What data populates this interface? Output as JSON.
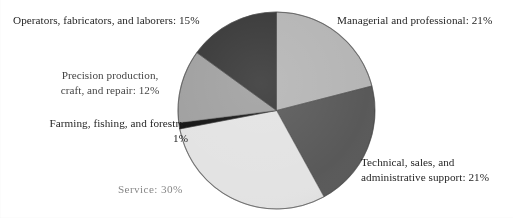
{
  "chart_data": {
    "type": "pie",
    "title": "",
    "subtitle": "",
    "xlabel": "",
    "ylabel": "",
    "legend_position": "none",
    "grid": false,
    "labels_position": "outside",
    "units": "percent",
    "total": 100,
    "categories": [
      "Managerial and professional",
      "Technical, sales, and administrative support",
      "Service",
      "Farming, fishing, and forestry",
      "Precision production, craft, and repair",
      "Operators, fabricators, and laborers"
    ],
    "values": [
      21,
      21,
      30,
      1,
      12,
      15
    ],
    "colors": [
      "#b5b5b5",
      "#595959",
      "#e3e3e3",
      "#141414",
      "#a0a0a0",
      "#383838"
    ],
    "slices": [
      {
        "name": "Managerial and professional",
        "value": 21,
        "value_text": "21%",
        "label_text": "Managerial and professional: 21%",
        "color": "#b5b5b5",
        "start_angle": 0,
        "end_angle": 75.6
      },
      {
        "name": "Technical, sales, and administrative support",
        "value": 21,
        "value_text": "21%",
        "label_text": "Technical, sales, and administrative support: 21%",
        "color": "#595959",
        "start_angle": 75.6,
        "end_angle": 151.2
      },
      {
        "name": "Service",
        "value": 30,
        "value_text": "30%",
        "label_text": "Service: 30%",
        "color": "#e3e3e3",
        "start_angle": 151.2,
        "end_angle": 259.2
      },
      {
        "name": "Farming, fishing, and forestry",
        "value": 1,
        "value_text": "1%",
        "label_text": "Farming, fishing, and forestry: 1%",
        "color": "#141414",
        "start_angle": 259.2,
        "end_angle": 262.8
      },
      {
        "name": "Precision production, craft, and repair",
        "value": 12,
        "value_text": "12%",
        "label_text": "Precision production, craft, and repair: 12%",
        "color": "#a0a0a0",
        "start_angle": 262.8,
        "end_angle": 306.0
      },
      {
        "name": "Operators, fabricators, and laborers",
        "value": 15,
        "value_text": "15%",
        "label_text": "Operators, fabricators, and laborers: 15%",
        "color": "#383838",
        "start_angle": 306.0,
        "end_angle": 360.0
      }
    ]
  },
  "labels": {
    "operators": "Operators, fabricators, and laborers: 15%",
    "managerial": "Managerial and professional: 21%",
    "precision_line1": "Precision production,",
    "precision_line2": "craft, and repair: 12%",
    "farming_line1": "Farming, fishing, and forestry:",
    "farming_line2": "1%",
    "service": "Service: 30%",
    "technical_line1": "Technical, sales, and",
    "technical_line2": "administrative support: 21%"
  }
}
